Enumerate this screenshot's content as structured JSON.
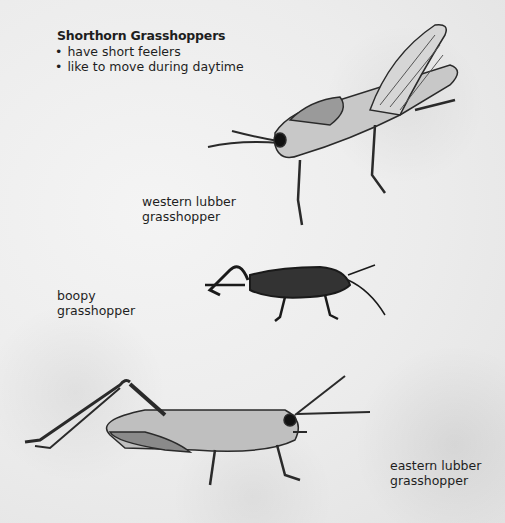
{
  "heading": "Shorthorn Grasshoppers",
  "bullets": [
    "have short feelers",
    "like to move during daytime"
  ],
  "labels": {
    "western": [
      "western lubber",
      "grasshopper"
    ],
    "boopy": [
      "boopy",
      "grasshopper"
    ],
    "eastern": [
      "eastern lubber",
      "grasshopper"
    ]
  },
  "illustrations": [
    {
      "name": "western lubber grasshopper",
      "style": "light with striped wings"
    },
    {
      "name": "boopy grasshopper",
      "style": "dark"
    },
    {
      "name": "eastern lubber grasshopper",
      "style": "spotted"
    }
  ]
}
